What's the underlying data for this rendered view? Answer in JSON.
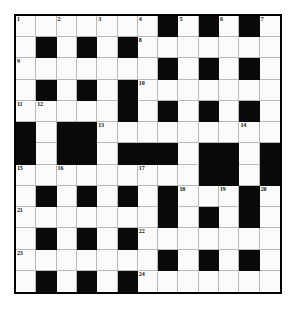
{
  "puzzle": {
    "title": "Crossword Grid",
    "size": {
      "rows": 13,
      "cols": 13
    },
    "colors": {
      "block": "#0a0a0a",
      "cell": "#fbfbfb",
      "grid_line": "#b9b9b9",
      "border": "#000000",
      "page": "#ffffff",
      "number_text": "#111111"
    },
    "blocks": [
      [
        0,
        7
      ],
      [
        0,
        9
      ],
      [
        0,
        11
      ],
      [
        1,
        1
      ],
      [
        1,
        3
      ],
      [
        1,
        5
      ],
      [
        2,
        7
      ],
      [
        2,
        9
      ],
      [
        2,
        11
      ],
      [
        3,
        1
      ],
      [
        3,
        3
      ],
      [
        3,
        5
      ],
      [
        4,
        5
      ],
      [
        4,
        7
      ],
      [
        4,
        9
      ],
      [
        4,
        11
      ],
      [
        5,
        0
      ],
      [
        5,
        2
      ],
      [
        5,
        3
      ],
      [
        6,
        0
      ],
      [
        6,
        2
      ],
      [
        6,
        3
      ],
      [
        6,
        5
      ],
      [
        6,
        6
      ],
      [
        6,
        7
      ],
      [
        6,
        9
      ],
      [
        6,
        10
      ],
      [
        6,
        12
      ],
      [
        7,
        9
      ],
      [
        7,
        10
      ],
      [
        7,
        12
      ],
      [
        8,
        1
      ],
      [
        8,
        3
      ],
      [
        8,
        5
      ],
      [
        8,
        7
      ],
      [
        8,
        11
      ],
      [
        9,
        7
      ],
      [
        9,
        9
      ],
      [
        9,
        11
      ],
      [
        10,
        1
      ],
      [
        10,
        3
      ],
      [
        10,
        5
      ],
      [
        11,
        7
      ],
      [
        11,
        9
      ],
      [
        11,
        11
      ],
      [
        12,
        1
      ],
      [
        12,
        3
      ],
      [
        12,
        5
      ]
    ],
    "numbers": [
      {
        "n": "1",
        "row": 0,
        "col": 0
      },
      {
        "n": "2",
        "row": 0,
        "col": 2
      },
      {
        "n": "3",
        "row": 0,
        "col": 4
      },
      {
        "n": "4",
        "row": 0,
        "col": 6
      },
      {
        "n": "5",
        "row": 0,
        "col": 8
      },
      {
        "n": "6",
        "row": 0,
        "col": 10
      },
      {
        "n": "7",
        "row": 0,
        "col": 12
      },
      {
        "n": "8",
        "row": 1,
        "col": 6
      },
      {
        "n": "9",
        "row": 2,
        "col": 0
      },
      {
        "n": "10",
        "row": 3,
        "col": 6
      },
      {
        "n": "11",
        "row": 4,
        "col": 0
      },
      {
        "n": "12",
        "row": 4,
        "col": 1
      },
      {
        "n": "13",
        "row": 5,
        "col": 4
      },
      {
        "n": "14",
        "row": 5,
        "col": 11
      },
      {
        "n": "15",
        "row": 7,
        "col": 0
      },
      {
        "n": "16",
        "row": 7,
        "col": 2
      },
      {
        "n": "17",
        "row": 7,
        "col": 6
      },
      {
        "n": "18",
        "row": 8,
        "col": 8
      },
      {
        "n": "19",
        "row": 8,
        "col": 10
      },
      {
        "n": "20",
        "row": 8,
        "col": 12
      },
      {
        "n": "21",
        "row": 9,
        "col": 0
      },
      {
        "n": "22",
        "row": 10,
        "col": 6
      },
      {
        "n": "23",
        "row": 11,
        "col": 0
      },
      {
        "n": "24",
        "row": 12,
        "col": 6
      }
    ]
  }
}
